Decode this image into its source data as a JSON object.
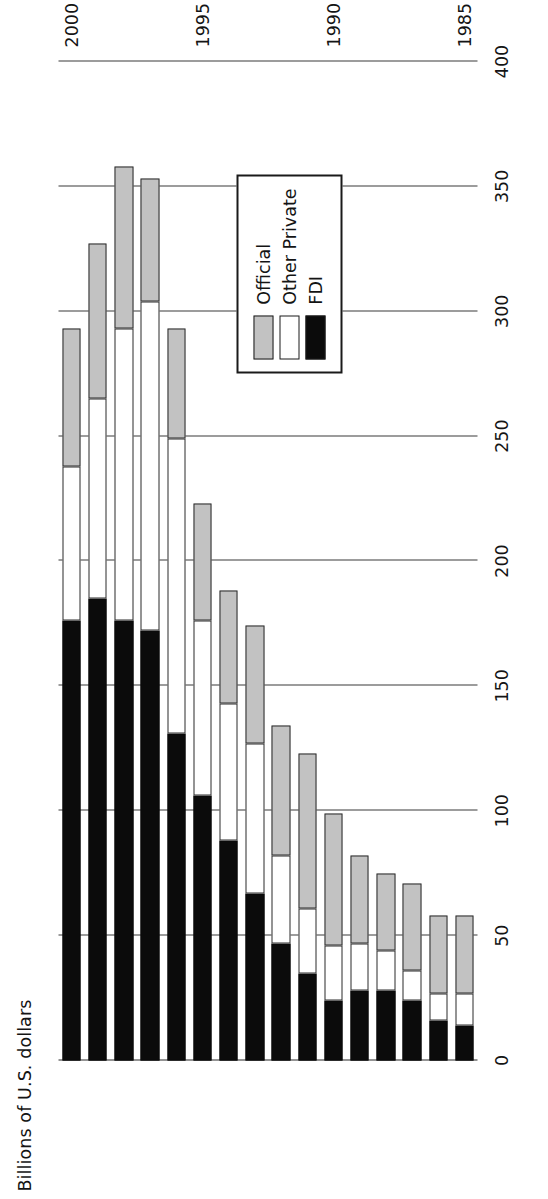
{
  "chart_data": {
    "type": "bar",
    "orientation": "horizontal-rotated",
    "title": "",
    "xlabel": "",
    "ylabel": "Billions of U.S. dollars",
    "stacked": true,
    "grid": true,
    "value_axis": {
      "ticks": [
        0,
        50,
        100,
        150,
        200,
        250,
        300,
        350,
        400
      ],
      "tick_labels": [
        "0",
        "50",
        "100",
        "150",
        "200",
        "250",
        "300",
        "350",
        "400"
      ],
      "lim": [
        0,
        400
      ]
    },
    "category_axis": {
      "tick_labels": [
        "1985",
        "1990",
        "1995",
        "2000"
      ],
      "labeled_categories": [
        "1985",
        "1990",
        "1995",
        "2000"
      ]
    },
    "categories": [
      "1985",
      "1986",
      "1987",
      "1988",
      "1989",
      "1990",
      "1991",
      "1992",
      "1993",
      "1994",
      "1995",
      "1996",
      "1997",
      "1998",
      "1999",
      "2000"
    ],
    "legend": {
      "position": "inside-lower-left",
      "entries": [
        {
          "label": "Official",
          "color": "#c2c2c2"
        },
        {
          "label": "Other Private",
          "color": "#ffffff"
        },
        {
          "label": "FDI",
          "color": "#0b0b0b"
        }
      ]
    },
    "series": [
      {
        "name": "FDI",
        "color": "#0b0b0b",
        "values": [
          14,
          16,
          24,
          28,
          28,
          24,
          35,
          47,
          67,
          88,
          106,
          131,
          172,
          176,
          185,
          176
        ]
      },
      {
        "name": "Other Private",
        "color": "#ffffff",
        "values": [
          13,
          11,
          12,
          16,
          19,
          22,
          26,
          35,
          60,
          55,
          70,
          118,
          132,
          117,
          80,
          62
        ]
      },
      {
        "name": "Official",
        "color": "#c2c2c2",
        "values": [
          31,
          31,
          35,
          31,
          35,
          53,
          62,
          52,
          47,
          45,
          47,
          44,
          49,
          65,
          62,
          55
        ]
      }
    ],
    "totals": [
      58,
      58,
      71,
      75,
      82,
      99,
      123,
      134,
      174,
      188,
      223,
      293,
      353,
      358,
      327,
      293
    ]
  }
}
